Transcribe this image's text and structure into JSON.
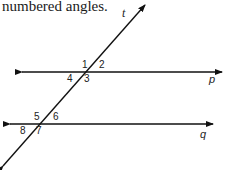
{
  "caption": "numbered angles.",
  "figure": {
    "transversal": {
      "label": "t"
    },
    "lines": [
      {
        "label": "p"
      },
      {
        "label": "q"
      }
    ],
    "angles": [
      "1",
      "2",
      "3",
      "4",
      "5",
      "6",
      "7",
      "8"
    ],
    "stroke_color": "#111111"
  }
}
